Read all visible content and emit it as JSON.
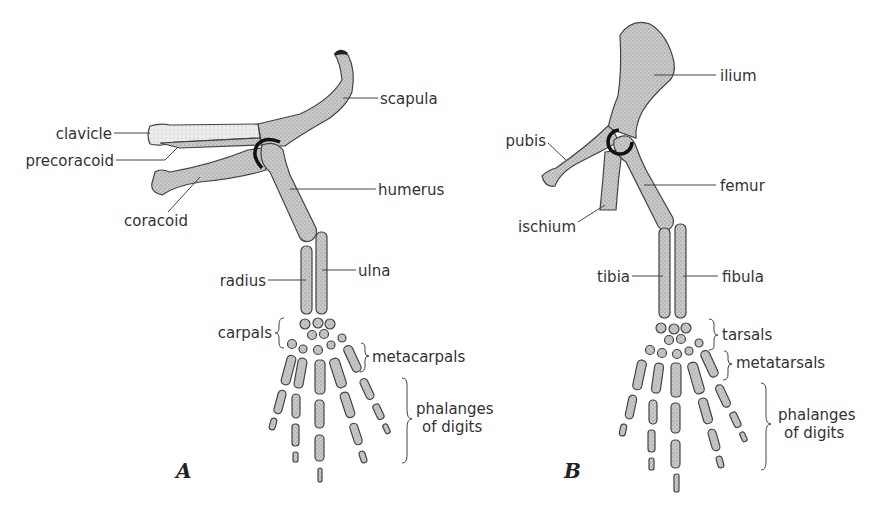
{
  "figure": {
    "panels": [
      {
        "id": "A",
        "label": "A",
        "subject": "forelimb and pectoral girdle",
        "labels": {
          "scapula": "scapula",
          "clavicle": "clavicle",
          "precoracoid": "precoracoid",
          "humerus": "humerus",
          "coracoid": "coracoid",
          "radius": "radius",
          "ulna": "ulna",
          "carpals": "carpals",
          "metacarpals": "metacarpals",
          "phalanges_line1": "phalanges",
          "phalanges_line2": "of digits"
        }
      },
      {
        "id": "B",
        "label": "B",
        "subject": "hindlimb and pelvic girdle",
        "labels": {
          "ilium": "ilium",
          "pubis": "pubis",
          "femur": "femur",
          "ischium": "ischium",
          "tibia": "tibia",
          "fibula": "fibula",
          "tarsals": "tarsals",
          "metatarsals": "metatarsals",
          "phalanges_line1": "phalanges",
          "phalanges_line2": "of digits"
        }
      }
    ]
  }
}
